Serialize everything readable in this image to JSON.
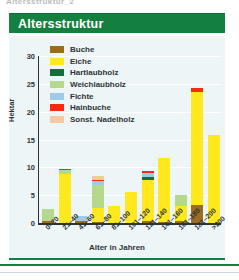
{
  "page": {
    "cut_caption": "Altersstruktur_2",
    "title": "Altersstruktur"
  },
  "colors": {
    "banner_green": "#148040",
    "panel_background": "#eef5f7",
    "axis": "#2e3436",
    "gridline": "#ffffff"
  },
  "legend": {
    "position": "top-left-inside",
    "items": [
      {
        "label": "Buche",
        "color": "#9a6b21"
      },
      {
        "label": "Eiche",
        "color": "#ffe81c"
      },
      {
        "label": "Hartlaubholz",
        "color": "#14703a"
      },
      {
        "label": "Weichlaubholz",
        "color": "#b5d98c"
      },
      {
        "label": "Fichte",
        "color": "#9dcbe8"
      },
      {
        "label": "Hainbuche",
        "color": "#f42a11"
      },
      {
        "label": "Sonst. Nadelholz",
        "color": "#f7c9a0"
      }
    ]
  },
  "chart_data": {
    "type": "bar",
    "stacked": true,
    "title": "Altersstruktur",
    "xlabel": "Alter in Jahren",
    "ylabel": "Hektar",
    "ylim": [
      0,
      30
    ],
    "yticks": [
      0,
      5,
      10,
      15,
      20,
      25,
      30
    ],
    "grid": true,
    "categories": [
      "0–20",
      "21–40",
      "41–60",
      "61–80",
      "81–100",
      "101–120",
      "121–140",
      "141–160",
      "161–180",
      "181–200",
      ">200"
    ],
    "series": [
      {
        "name": "Buche",
        "color": "#9a6b21",
        "values": [
          0.4,
          0.0,
          0.3,
          0.2,
          0.0,
          0.0,
          0.3,
          0.2,
          0.3,
          3.2,
          0.0
        ]
      },
      {
        "name": "Eiche",
        "color": "#ffe81c",
        "values": [
          0.0,
          8.8,
          0.0,
          2.5,
          3.0,
          5.6,
          7.5,
          11.4,
          2.7,
          20.4,
          15.8
        ]
      },
      {
        "name": "Hartlaubholz",
        "color": "#14703a",
        "values": [
          0.0,
          0.0,
          0.0,
          0.0,
          0.0,
          0.0,
          0.4,
          0.0,
          0.0,
          0.0,
          0.0
        ]
      },
      {
        "name": "Weichlaubholz",
        "color": "#b5d98c",
        "values": [
          2.1,
          0.7,
          0.0,
          4.2,
          0.0,
          0.0,
          0.0,
          0.0,
          2.1,
          0.0,
          0.0
        ]
      },
      {
        "name": "Fichte",
        "color": "#9dcbe8",
        "values": [
          0.0,
          0.0,
          1.0,
          0.6,
          0.0,
          0.0,
          0.8,
          0.0,
          0.0,
          0.0,
          0.0
        ]
      },
      {
        "name": "Hainbuche",
        "color": "#f42a11",
        "values": [
          0.0,
          0.2,
          0.0,
          0.3,
          0.0,
          0.0,
          0.4,
          0.0,
          0.0,
          0.6,
          0.0
        ]
      },
      {
        "name": "Sonst. Nadelholz",
        "color": "#f7c9a0",
        "values": [
          0.0,
          0.0,
          0.0,
          0.7,
          0.0,
          0.0,
          0.0,
          0.0,
          0.0,
          0.0,
          0.0
        ]
      }
    ],
    "totals": [
      2.5,
      9.7,
      1.3,
      8.5,
      3.0,
      5.6,
      9.4,
      11.6,
      5.1,
      24.2,
      15.8
    ]
  }
}
